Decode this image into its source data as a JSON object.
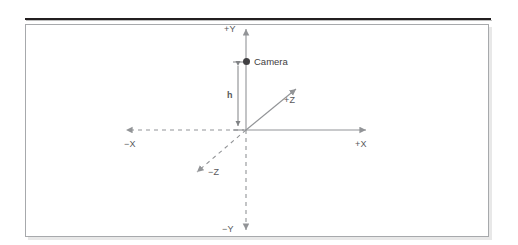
{
  "figure": {
    "title_rule": "horizontal-rule",
    "diagram_type": "3d-coordinate-axes",
    "labels": {
      "y_positive": "+Y",
      "y_negative": "−Y",
      "x_positive": "+X",
      "x_negative": "−X",
      "z_positive": "+Z",
      "z_negative": "−Z",
      "height": "h",
      "camera": "Camera"
    },
    "colors": {
      "axis_line": "#929497",
      "label_text": "#58595b",
      "camera_marker": "#414042",
      "frame_border": "#a7a9ac",
      "top_rule": "#231f20",
      "background": "#ffffff"
    },
    "geometry": {
      "origin_x": 246,
      "origin_y": 130,
      "camera_x": 246,
      "camera_y": 62,
      "height_dimension_label": "h"
    },
    "line_styles": {
      "positive_axes": "solid",
      "negative_axes": "dashed"
    }
  }
}
